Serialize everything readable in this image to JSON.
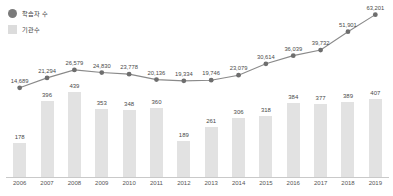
{
  "legend": {
    "position": "top-left",
    "items": [
      {
        "label": "학습자 수",
        "marker": "circle-marker-icon",
        "color": "#7a7a7a",
        "series": "line"
      },
      {
        "label": "기관수",
        "marker": "square-swatch-icon",
        "color": "#dcdcdc",
        "series": "bar"
      }
    ]
  },
  "colors": {
    "line": "#8a8a8a",
    "point": "#6e6e6e",
    "bar": "#e2e2e2",
    "axis": "#c9c9c9",
    "text": "#4a4a4a"
  },
  "chart_data": {
    "type": "bar",
    "title": "",
    "xlabel": "",
    "ylabel": "",
    "grid": false,
    "legend_position": "top-left",
    "categories": [
      "2006",
      "2007",
      "2008",
      "2009",
      "2010",
      "2011",
      "2012",
      "2013",
      "2014",
      "2015",
      "2016",
      "2017",
      "2018",
      "2019"
    ],
    "series": [
      {
        "name": "학습자 수",
        "type": "line",
        "axis": "secondary",
        "values": [
          14689,
          21294,
          26579,
          24830,
          23778,
          20136,
          19334,
          19746,
          23079,
          30614,
          36039,
          39732,
          51901,
          63201
        ],
        "labels": [
          "14,689",
          "21,294",
          "26,579",
          "24,830",
          "23,778",
          "20,136",
          "19,334",
          "19,746",
          "23,079",
          "30,614",
          "36,039",
          "39,732",
          "51,901",
          "63,201"
        ],
        "ylim": [
          0,
          70000
        ]
      },
      {
        "name": "기관수",
        "type": "bar",
        "axis": "primary",
        "values": [
          178,
          396,
          439,
          353,
          348,
          360,
          189,
          261,
          306,
          318,
          384,
          377,
          389,
          407
        ],
        "labels": [
          "178",
          "396",
          "439",
          "353",
          "348",
          "360",
          "189",
          "261",
          "306",
          "318",
          "384",
          "377",
          "389",
          "407"
        ],
        "ylim": [
          0,
          500
        ]
      }
    ]
  }
}
